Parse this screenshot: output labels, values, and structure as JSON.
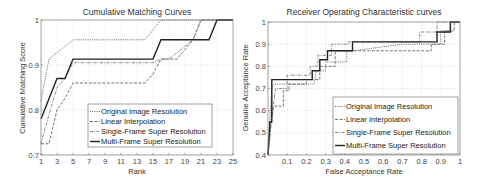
{
  "chart_data": [
    {
      "type": "line",
      "title": "Cumulative Matching Curves",
      "xlabel": "Rank",
      "ylabel": "Cumulative Matching Score",
      "xlim": [
        1,
        25
      ],
      "ylim": [
        0.7,
        1.0
      ],
      "xticks": [
        1,
        3,
        5,
        7,
        9,
        11,
        13,
        15,
        17,
        19,
        21,
        23,
        25
      ],
      "yticks": [
        0.7,
        0.8,
        0.9,
        1
      ],
      "ytick_labels": [
        "0.7",
        "0.8",
        "0.9",
        "1"
      ],
      "grid": true,
      "legend_position": "lower right",
      "series": [
        {
          "name": "Original Image Resolution",
          "style": "dotted",
          "color": "#555555",
          "x": [
            1,
            2,
            5,
            14,
            16,
            22,
            23,
            25
          ],
          "y": [
            0.82,
            0.913,
            0.956,
            0.956,
            1.0,
            1.0,
            1.0,
            1.0
          ]
        },
        {
          "name": "Linear Interpolation",
          "style": "dashed",
          "color": "#666666",
          "x": [
            1,
            2,
            3,
            4,
            5,
            14,
            15,
            16,
            18,
            20,
            21,
            25
          ],
          "y": [
            0.725,
            0.725,
            0.8,
            0.826,
            0.86,
            0.86,
            0.88,
            0.913,
            0.913,
            0.956,
            1.0,
            1.0
          ]
        },
        {
          "name": "Single-Frame Super Resolution",
          "style": "dashdot",
          "color": "#777777",
          "x": [
            1,
            2,
            3,
            4,
            5,
            15,
            16,
            17,
            20,
            21,
            25
          ],
          "y": [
            0.725,
            0.79,
            0.85,
            0.87,
            0.905,
            0.905,
            0.913,
            0.913,
            0.956,
            1.0,
            1.0
          ]
        },
        {
          "name": "Multi-Frame Super Resolution",
          "style": "solid",
          "color": "#222222",
          "x": [
            1,
            3,
            4,
            5,
            15,
            16,
            22,
            23,
            25
          ],
          "y": [
            0.78,
            0.87,
            0.87,
            0.913,
            0.913,
            0.956,
            0.956,
            1.0,
            1.0
          ]
        }
      ]
    },
    {
      "type": "line",
      "title": "Receiver Operating Characteristic curves",
      "xlabel": "False Acceptance Rate",
      "ylabel": "Genuine Acceptance Rate",
      "xlim": [
        0,
        1
      ],
      "ylim": [
        0.4,
        1.0
      ],
      "xticks": [
        0.1,
        0.2,
        0.3,
        0.4,
        0.5,
        0.6,
        0.7,
        0.8,
        0.9,
        1
      ],
      "xtick_labels": [
        "0.1",
        "0.2",
        "0.3",
        "0.4",
        "0.5",
        "0.6",
        "0.7",
        "0.8",
        "0.9",
        "1"
      ],
      "yticks": [
        0.4,
        0.5,
        0.6,
        0.7,
        0.8,
        0.9,
        1
      ],
      "ytick_labels": [
        "0.4",
        "0.5",
        "0.6",
        "0.7",
        "0.8",
        "0.9",
        "1"
      ],
      "grid": true,
      "legend_position": "lower right",
      "series": [
        {
          "name": "Original Image Resolution",
          "style": "dotted",
          "color": "#555555",
          "x": [
            0.0,
            0.01,
            0.02,
            0.03,
            0.1,
            0.24,
            0.25,
            0.3,
            0.3,
            0.41,
            0.41,
            0.44,
            0.7,
            0.9,
            0.9,
            0.95,
            0.95,
            1.0
          ],
          "y": [
            0.4,
            0.56,
            0.7,
            0.72,
            0.72,
            0.72,
            0.78,
            0.78,
            0.82,
            0.82,
            0.87,
            0.87,
            0.9,
            0.9,
            0.96,
            0.96,
            1.0,
            1.0
          ]
        },
        {
          "name": "Linear Interpolation",
          "style": "dashed",
          "color": "#666666",
          "x": [
            0.0,
            0.02,
            0.03,
            0.08,
            0.08,
            0.11,
            0.11,
            0.2,
            0.2,
            0.27,
            0.27,
            0.35,
            0.35,
            0.63,
            0.85,
            0.85,
            0.92,
            0.92,
            0.97,
            0.97,
            1.0
          ],
          "y": [
            0.4,
            0.57,
            0.62,
            0.62,
            0.69,
            0.69,
            0.72,
            0.72,
            0.74,
            0.74,
            0.8,
            0.8,
            0.87,
            0.87,
            0.87,
            0.9,
            0.9,
            0.96,
            0.96,
            1.0,
            1.0
          ]
        },
        {
          "name": "Single-Frame Super Resolution",
          "style": "dashdot",
          "color": "#777777",
          "x": [
            0.0,
            0.02,
            0.04,
            0.1,
            0.1,
            0.22,
            0.22,
            0.26,
            0.26,
            0.33,
            0.33,
            0.42,
            0.42,
            0.79,
            0.79,
            0.88,
            0.88,
            0.97,
            0.97,
            1.0
          ],
          "y": [
            0.4,
            0.58,
            0.7,
            0.7,
            0.76,
            0.76,
            0.8,
            0.8,
            0.85,
            0.85,
            0.9,
            0.9,
            0.91,
            0.91,
            0.955,
            0.955,
            1.0,
            1.0,
            1.0,
            1.0
          ]
        },
        {
          "name": "Multi-Frame Super Resolution",
          "style": "solid",
          "color": "#222222",
          "x": [
            0.0,
            0.01,
            0.02,
            0.02,
            0.13,
            0.13,
            0.23,
            0.23,
            0.27,
            0.27,
            0.31,
            0.31,
            0.44,
            0.44,
            0.88,
            0.88,
            0.95,
            0.95,
            1.0
          ],
          "y": [
            0.4,
            0.55,
            0.55,
            0.74,
            0.74,
            0.74,
            0.74,
            0.78,
            0.78,
            0.83,
            0.83,
            0.87,
            0.87,
            0.91,
            0.91,
            0.955,
            0.955,
            1.0,
            1.0
          ]
        }
      ]
    }
  ]
}
